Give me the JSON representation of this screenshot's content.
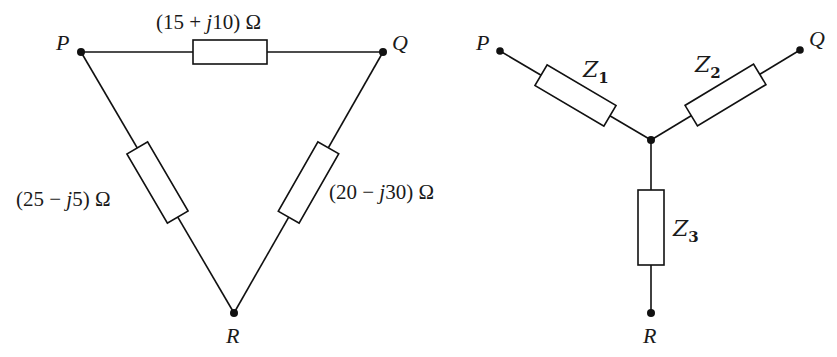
{
  "delta_network": {
    "nodes": {
      "P": {
        "label": "P"
      },
      "Q": {
        "label": "Q"
      },
      "R": {
        "label": "R"
      }
    },
    "impedances": {
      "PQ": {
        "open": "(15 + ",
        "j": "j",
        "rest": "10) Ω",
        "full": "(15 + j10) Ω"
      },
      "PR": {
        "open": "(25 − ",
        "j": "j",
        "rest": "5) Ω",
        "full": "(25 − j5) Ω"
      },
      "QR": {
        "open": "(20 − ",
        "j": "j",
        "rest": "30) Ω",
        "full": "(20 − j30) Ω"
      }
    }
  },
  "star_network": {
    "nodes": {
      "P": {
        "label": "P"
      },
      "Q": {
        "label": "Q"
      },
      "R": {
        "label": "R"
      }
    },
    "impedances": {
      "Z1": {
        "base": "Z",
        "sub": "1"
      },
      "Z2": {
        "base": "Z",
        "sub": "2"
      },
      "Z3": {
        "base": "Z",
        "sub": "3"
      }
    }
  }
}
